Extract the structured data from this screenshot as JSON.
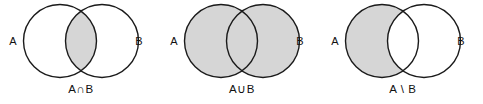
{
  "figure": {
    "panel_count": 3,
    "colors": {
      "shade": "#d6d6d6",
      "stroke": "#1a1a1a",
      "background": "#ffffff",
      "text": "#111111"
    },
    "geometry": {
      "panel_width": 161,
      "panel_height": 104,
      "circle_radius": 36.5,
      "circle_a_cx": 60,
      "circle_b_cx": 102,
      "circle_cy": 41,
      "label_a_x": 13,
      "label_b_x": 139,
      "label_y": 42,
      "caption_y": 93,
      "caption_x": 81
    }
  },
  "panels": [
    {
      "id": "intersection",
      "caption": "A∩B",
      "label_a": "A",
      "label_b": "B",
      "shaded_region": "lens",
      "operation_name": "intersection"
    },
    {
      "id": "union",
      "caption": "A∪B",
      "label_a": "A",
      "label_b": "B",
      "shaded_region": "both-circles",
      "operation_name": "union"
    },
    {
      "id": "difference",
      "caption": "A \\ B",
      "label_a": "A",
      "label_b": "B",
      "shaded_region": "a-minus-b",
      "operation_name": "difference"
    }
  ]
}
